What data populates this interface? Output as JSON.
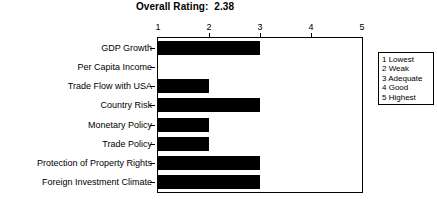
{
  "chart_data": {
    "type": "bar",
    "orientation": "horizontal",
    "title": "Overall Rating:  2.38",
    "overall_rating": "2.38",
    "xlabel": "",
    "ylabel": "",
    "xlim": [
      1,
      5
    ],
    "xticks": [
      "1",
      "2",
      "3",
      "4",
      "5"
    ],
    "grid": false,
    "legend_position": "right",
    "bar_color": "#000000",
    "categories": [
      "GDP Growth",
      "Per Capita Income",
      "Trade Flow with USA",
      "Country Risk",
      "Monetary Policy",
      "Trade Policy",
      "Protection of Property Rights",
      "Foreign Investment Climate"
    ],
    "values": [
      3,
      1,
      2,
      3,
      2,
      2,
      3,
      3
    ],
    "legend_entries": [
      "1 Lowest",
      "2 Weak",
      "3 Adequate",
      "4 Good",
      "5 Highest"
    ]
  }
}
